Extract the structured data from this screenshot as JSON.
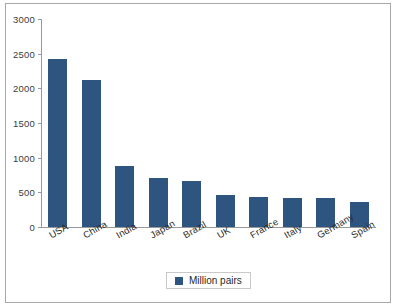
{
  "chart_data": {
    "type": "bar",
    "title": "",
    "subtitle": "",
    "xlabel": "",
    "ylabel": "",
    "categories": [
      "USA",
      "China",
      "India",
      "Japan",
      "Brazil",
      "UK",
      "France",
      "Italy",
      "Germany",
      "Spain"
    ],
    "values": [
      2420,
      2115,
      885,
      710,
      665,
      465,
      430,
      420,
      415,
      355
    ],
    "series": [
      {
        "name": "Million pairs",
        "values": [
          2420,
          2115,
          885,
          710,
          665,
          465,
          430,
          420,
          415,
          355
        ]
      }
    ],
    "ylim": [
      0,
      3000
    ],
    "yticks": [
      0,
      500,
      1000,
      1500,
      2000,
      2500,
      3000
    ],
    "ytick_labels": [
      "0",
      "500",
      "1000",
      "1500",
      "2000",
      "2500",
      "3000"
    ],
    "grid": false,
    "legend_position": "bottom",
    "bar_color": "#2e5580",
    "axis_color": "#999999",
    "frame_color": "#a8a8a8",
    "background": "#ffffff",
    "xlabel_rotation_deg": -30
  },
  "legend": {
    "entries": [
      {
        "label": "Million pairs",
        "color": "#2e5580",
        "marker": "square"
      }
    ]
  }
}
